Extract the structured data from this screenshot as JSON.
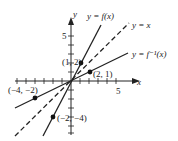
{
  "diagram": {
    "axes": {
      "x_label": "x",
      "y_label": "y",
      "x_tick_label": "5",
      "y_tick_label": "5",
      "x_ticks": [
        -6,
        -5,
        -4,
        -3,
        -2,
        -1,
        1,
        2,
        3,
        4,
        5
      ],
      "y_ticks": [
        -6,
        -5,
        -4,
        -3,
        -2,
        -1,
        1,
        2,
        3,
        4,
        5
      ]
    },
    "curves": [
      {
        "name": "f",
        "label": "y = f(x)",
        "equation": "y = 2x",
        "style": "solid"
      },
      {
        "name": "identity",
        "label": "y = x",
        "equation": "y = x",
        "style": "dashed"
      },
      {
        "name": "f_inverse",
        "label": "y = f⁻¹(x)",
        "equation": "y = x/2",
        "style": "solid"
      }
    ],
    "points": [
      {
        "label": "(1, 2)",
        "x": 1,
        "y": 2
      },
      {
        "label": "(2, 1)",
        "x": 2,
        "y": 1
      },
      {
        "label": "(−4, −2)",
        "x": -4,
        "y": -2
      },
      {
        "label": "(−2, −4)",
        "x": -2,
        "y": -4
      }
    ],
    "colors": {
      "ink": "#222222",
      "background": "#ffffff"
    }
  }
}
